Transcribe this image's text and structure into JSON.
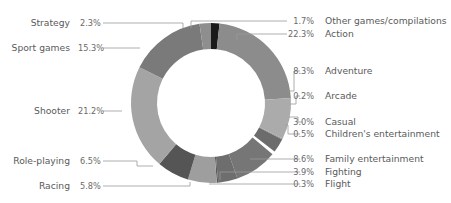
{
  "chart_data": {
    "type": "pie",
    "variant": "donut",
    "title": "",
    "title_note": "Title clipped at top edge, not legible",
    "unit": "%",
    "start_angle": "top (12 o'clock)",
    "direction": "clockwise",
    "categories": [
      "Other games/compilations",
      "Action",
      "Adventure",
      "Arcade",
      "Casual",
      "Children's entertainment",
      "Family entertainment",
      "Fighting",
      "Flight",
      "Racing",
      "Role-playing",
      "Shooter",
      "Sport games",
      "Strategy"
    ],
    "values": [
      1.7,
      22.3,
      8.3,
      0.2,
      3.0,
      0.5,
      8.6,
      3.9,
      0.3,
      5.8,
      6.5,
      21.2,
      15.3,
      2.3
    ],
    "labels": [
      "1.7%",
      "22.3%",
      "8.3%",
      "0.2%",
      "3.0%",
      "0.5%",
      "8.6%",
      "3.9%",
      "0.3%",
      "5.8%",
      "6.5%",
      "21.2%",
      "15.3%",
      "2.3%"
    ],
    "colors": [
      "#1a1a1a",
      "#8c8c8c",
      "#ababab",
      "#9a9a9a",
      "#6c6c6c",
      "#ffffff",
      "#767676",
      "#6e6e6e",
      "#5a5a5a",
      "#9e9e9e",
      "#555555",
      "#a4a4a4",
      "#7a7a7a",
      "#8e8e8e"
    ],
    "legend_position": "leader-line labels around donut",
    "grid": false
  },
  "legend": {
    "right": [
      {
        "pct": "1.7%",
        "label": "Other games/compilations"
      },
      {
        "pct": "22.3%",
        "label": "Action"
      },
      {
        "pct": "8.3%",
        "label": "Adventure"
      },
      {
        "pct": "0.2%",
        "label": "Arcade"
      },
      {
        "pct": "3.0%",
        "label": "Casual"
      },
      {
        "pct": "0.5%",
        "label": "Children's entertainment"
      },
      {
        "pct": "8.6%",
        "label": "Family entertainment"
      },
      {
        "pct": "3.9%",
        "label": "Fighting"
      },
      {
        "pct": "0.3%",
        "label": "Flight"
      }
    ],
    "left": [
      {
        "pct": "2.3%",
        "label": "Strategy"
      },
      {
        "pct": "15.3%",
        "label": "Sport games"
      },
      {
        "pct": "21.2%",
        "label": "Shooter"
      },
      {
        "pct": "6.5%",
        "label": "Role-playing"
      },
      {
        "pct": "5.8%",
        "label": "Racing"
      }
    ]
  }
}
